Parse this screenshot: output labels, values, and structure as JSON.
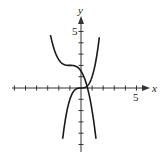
{
  "chart_data": {
    "type": "line",
    "title": "",
    "xlabel": "x",
    "ylabel": "y",
    "xlim": [
      -6,
      6
    ],
    "ylim": [
      -5.5,
      6.5
    ],
    "xticks": [
      -6,
      -5,
      -4,
      -3,
      -2,
      -1,
      1,
      2,
      3,
      4,
      5
    ],
    "yticks": [
      -5,
      -4,
      -3,
      -2,
      -1,
      1,
      2,
      3,
      4,
      5
    ],
    "tick_labels": {
      "x": "5",
      "y": "5"
    },
    "grid": false,
    "legend": null,
    "series": [
      {
        "name": "decreasing cubic",
        "formula": "y = -0.5(x+1)^3 + 2",
        "x": [
          -2.75,
          -2.5,
          -2.0,
          -1.5,
          -1.0,
          -0.5,
          0.0,
          0.5,
          1.0,
          1.35
        ],
        "y": [
          4.7,
          3.69,
          2.5,
          2.06,
          2.0,
          1.94,
          1.5,
          0.31,
          -2.0,
          -4.5
        ]
      },
      {
        "name": "increasing cubic",
        "formula": "y = x^3",
        "x": [
          -1.65,
          -1.5,
          -1.0,
          -0.5,
          0.0,
          0.5,
          1.0,
          1.5,
          1.65
        ],
        "y": [
          -4.5,
          -3.38,
          -1.0,
          -0.13,
          0.0,
          0.13,
          1.0,
          3.38,
          4.5
        ]
      }
    ],
    "colors": {
      "curve": "#1a1a1a",
      "axis": "#333333"
    }
  }
}
